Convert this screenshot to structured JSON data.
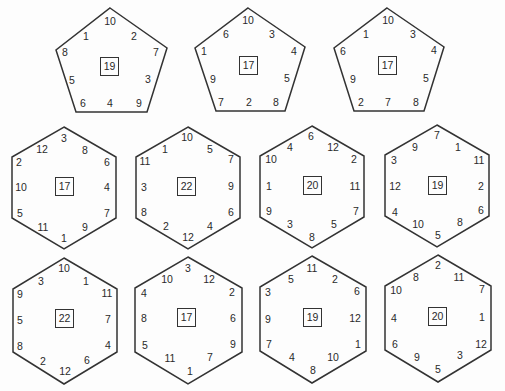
{
  "line_color": "#333333",
  "pentagons": [
    {
      "center": "19",
      "top": "10",
      "upper_left": "1",
      "upper_right": "2",
      "left": "8",
      "right": "7",
      "mid_left": "5",
      "mid_right": "3",
      "bottom_left": "6",
      "bottom_mid": "4",
      "bottom_right": "9"
    },
    {
      "center": "17",
      "top": "10",
      "upper_left": "6",
      "upper_right": "3",
      "left": "1",
      "right": "4",
      "mid_left": "9",
      "mid_right": "5",
      "bottom_left": "7",
      "bottom_mid": "2",
      "bottom_right": "8"
    },
    {
      "center": "17",
      "top": "10",
      "upper_left": "1",
      "upper_right": "3",
      "left": "6",
      "right": "4",
      "mid_left": "9",
      "mid_right": "5",
      "bottom_left": "2",
      "bottom_mid": "7",
      "bottom_right": "8"
    }
  ],
  "hexagons": [
    {
      "center": "17",
      "top": "3",
      "top_left": "12",
      "top_right": "8",
      "ul": "2",
      "ur": "6",
      "ml": "10",
      "mr": "4",
      "ll": "5",
      "lr": "7",
      "bot_left": "11",
      "bot_right": "9",
      "bottom": "1"
    },
    {
      "center": "22",
      "top": "10",
      "top_left": "1",
      "top_right": "5",
      "ul": "11",
      "ur": "7",
      "ml": "3",
      "mr": "9",
      "ll": "8",
      "lr": "6",
      "bot_left": "2",
      "bot_right": "4",
      "bottom": "12"
    },
    {
      "center": "20",
      "top": "6",
      "top_left": "4",
      "top_right": "12",
      "ul": "10",
      "ur": "2",
      "ml": "1",
      "mr": "11",
      "ll": "9",
      "lr": "7",
      "bot_left": "3",
      "bot_right": "5",
      "bottom": "8"
    },
    {
      "center": "19",
      "top": "7",
      "top_left": "9",
      "top_right": "1",
      "ul": "3",
      "ur": "11",
      "ml": "12",
      "mr": "2",
      "ll": "4",
      "lr": "6",
      "bot_left": "10",
      "bot_right": "8",
      "bottom": "5"
    },
    {
      "center": "22",
      "top": "10",
      "top_left": "3",
      "top_right": "1",
      "ul": "9",
      "ur": "11",
      "ml": "5",
      "mr": "7",
      "ll": "8",
      "lr": "4",
      "bot_left": "2",
      "bot_right": "6",
      "bottom": "12"
    },
    {
      "center": "17",
      "top": "3",
      "top_left": "10",
      "top_right": "12",
      "ul": "4",
      "ur": "2",
      "ml": "8",
      "mr": "6",
      "ll": "5",
      "lr": "9",
      "bot_left": "11",
      "bot_right": "7",
      "bottom": "1"
    },
    {
      "center": "19",
      "top": "11",
      "top_left": "5",
      "top_right": "2",
      "ul": "3",
      "ur": "6",
      "ml": "9",
      "mr": "12",
      "ll": "7",
      "lr": "1",
      "bot_left": "4",
      "bot_right": "10",
      "bottom": "8"
    },
    {
      "center": "20",
      "top": "2",
      "top_left": "8",
      "top_right": "11",
      "ul": "10",
      "ur": "7",
      "ml": "4",
      "mr": "1",
      "ll": "6",
      "lr": "12",
      "bot_left": "9",
      "bot_right": "3",
      "bottom": "5"
    }
  ]
}
